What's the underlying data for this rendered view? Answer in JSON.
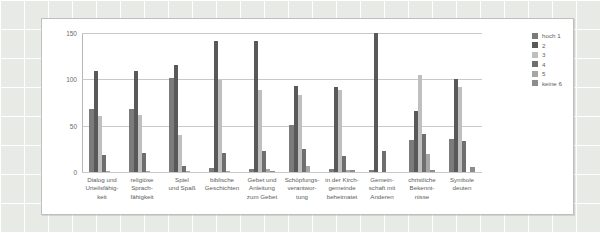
{
  "chart_data": {
    "type": "bar",
    "title": "",
    "xlabel": "",
    "ylabel": "",
    "ylim": [
      0,
      150
    ],
    "yticks": [
      0,
      50,
      100,
      150
    ],
    "grid": true,
    "legend_position": "right",
    "categories": [
      "Dialog und\nUrteilsfähig-\nkeit",
      "religiöse\nSprach-\nfähigkeit",
      "Spiel\nund Spaß",
      "biblische\nGeschichten",
      "Gebet und\nAnleitung\nzum Gebet",
      "Schöpfungs-\nverantwor-\ntung",
      "in der Kirch-\ngemeinde\nbeheimatet",
      "Gemein-\nschaft mit\nAnderen",
      "christliche\nBekennt-\nnisse",
      "Symbole\ndeuten"
    ],
    "series": [
      {
        "name": "hoch 1",
        "color": "#7b7b7b",
        "values": [
          68,
          68,
          101,
          4,
          3,
          51,
          3,
          2,
          35,
          36
        ]
      },
      {
        "name": "2",
        "color": "#595959",
        "values": [
          109,
          109,
          115,
          141,
          141,
          93,
          92,
          150,
          66,
          100
        ]
      },
      {
        "name": "3",
        "color": "#bfbfbf",
        "values": [
          60,
          61,
          40,
          99,
          88,
          83,
          88,
          0,
          105,
          92
        ]
      },
      {
        "name": "4",
        "color": "#6e6e6e",
        "values": [
          18,
          20,
          6,
          21,
          23,
          25,
          17,
          23,
          41,
          33
        ]
      },
      {
        "name": "5",
        "color": "#a6a6a6",
        "values": [
          1,
          1,
          1,
          1,
          3,
          7,
          2,
          0,
          19,
          0
        ]
      },
      {
        "name": "keine 6",
        "color": "#8c8c8c",
        "values": [
          0,
          0,
          0,
          0,
          1,
          0,
          2,
          0,
          2,
          5
        ]
      }
    ]
  }
}
